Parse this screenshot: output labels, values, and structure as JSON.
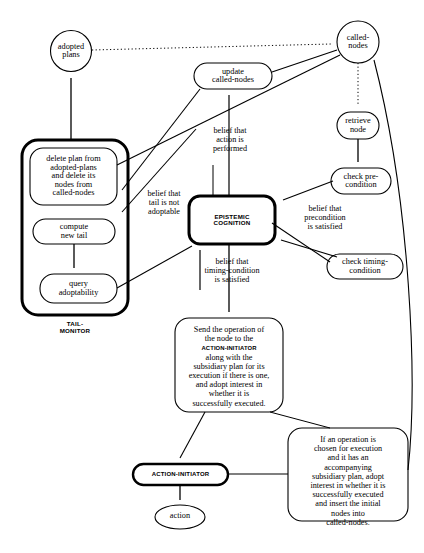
{
  "diagram": {
    "nodes": {
      "adopted_plans": "adopted\nplans",
      "called_nodes": "called-\nnodes",
      "update_called_nodes": "update\ncalled-nodes",
      "retrieve_node": "retrieve\nnode",
      "check_precondition": "check pre-\ncondition",
      "check_timing_condition": "check timing-\ncondition",
      "epistemic_cognition": "EPISTEMIC\nCOGNITION",
      "delete_plan": "delete plan from\nadopted-plans\nand delete its\nnodes from\ncalled-nodes",
      "compute_new_tail": "compute\nnew tail",
      "query_adoptability": "query\nadoptability",
      "tail_monitor": "TAIL-\nMONITOR",
      "send_operation_line1": "Send the operation of",
      "send_operation_line2": "the node to the",
      "send_operation_line3": "ACTION-INITIATOR",
      "send_operation_line4": "along with the",
      "send_operation_line5": "subsidiary plan for its",
      "send_operation_line6": "execution if there is one,",
      "send_operation_line7": "and adopt interest in",
      "send_operation_line8": "whether it is",
      "send_operation_line9": "successfully executed.",
      "action_initiator": "ACTION-INITIATOR",
      "action": "action",
      "if_operation": "If an operation is\nchosen for execution\nand it has an\naccompanying\nsubsidiary plan, adopt\ninterest in whether it is\nsuccessfully executed\nand insert the initial\nnodes into\ncalled-nodes."
    },
    "edge_labels": {
      "belief_action_performed": "belief that\naction is\nperformed",
      "belief_tail_not_adoptable": "belief that\ntail is not\nadoptable",
      "belief_precondition_satisfied": "belief that\nprecondition\nis satisfied",
      "belief_timing_satisfied": "belief that\ntiming-condition\nis satisfied"
    },
    "colors": {
      "stroke": "#000000",
      "background": "#ffffff"
    }
  }
}
